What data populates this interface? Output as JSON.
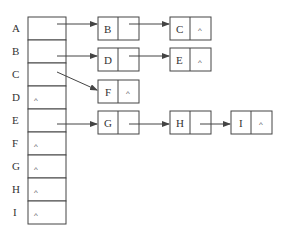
{
  "diagram": {
    "type": "adjacency-list",
    "null_symbol": "^",
    "colors": {
      "stroke": "#444444",
      "text": "#333333",
      "background": "#ffffff"
    },
    "head_table": {
      "rows": [
        {
          "label": "A",
          "pointer": "B"
        },
        {
          "label": "B",
          "pointer": "D"
        },
        {
          "label": "C",
          "pointer": "F"
        },
        {
          "label": "D",
          "pointer": null
        },
        {
          "label": "E",
          "pointer": "G"
        },
        {
          "label": "F",
          "pointer": null
        },
        {
          "label": "G",
          "pointer": null
        },
        {
          "label": "H",
          "pointer": null
        },
        {
          "label": "I",
          "pointer": null
        }
      ]
    },
    "nodes": [
      {
        "id": "B",
        "label": "B",
        "next": "C"
      },
      {
        "id": "C",
        "label": "C",
        "next": null
      },
      {
        "id": "D",
        "label": "D",
        "next": "E"
      },
      {
        "id": "E",
        "label": "E",
        "next": null
      },
      {
        "id": "F",
        "label": "F",
        "next": null
      },
      {
        "id": "G",
        "label": "G",
        "next": "H"
      },
      {
        "id": "H",
        "label": "H",
        "next": "I"
      },
      {
        "id": "I",
        "label": "I",
        "next": null
      }
    ],
    "lists": [
      {
        "head": "A",
        "chain": [
          "B",
          "C"
        ]
      },
      {
        "head": "B",
        "chain": [
          "D",
          "E"
        ]
      },
      {
        "head": "C",
        "chain": [
          "F"
        ]
      },
      {
        "head": "E",
        "chain": [
          "G",
          "H",
          "I"
        ]
      }
    ]
  }
}
